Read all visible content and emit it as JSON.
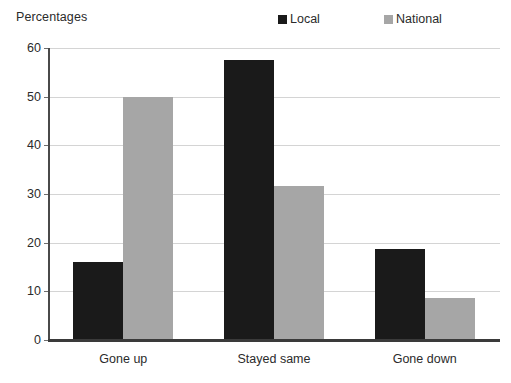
{
  "chart_data": {
    "type": "bar",
    "title": "",
    "ylabel": "Percentages",
    "xlabel": "",
    "categories": [
      "Gone up",
      "Stayed same",
      "Gone down"
    ],
    "series": [
      {
        "name": "Local",
        "color": "#1a1a1a",
        "values": [
          16.0,
          57.5,
          18.8
        ]
      },
      {
        "name": "National",
        "color": "#a6a6a6",
        "values": [
          49.9,
          31.7,
          8.7
        ]
      }
    ],
    "ylim": [
      0,
      60
    ],
    "yticks": [
      0,
      10,
      20,
      30,
      40,
      50,
      60
    ],
    "ytick_labels": [
      "0",
      "10",
      "20",
      "30",
      "40",
      "50",
      "60"
    ],
    "grid": true,
    "grid_axis": "y",
    "legend_position": "top-right",
    "legend_marker": "square-icon"
  },
  "colors": {
    "local": "#1a1a1a",
    "national": "#a6a6a6",
    "gridline": "#d4d4d4",
    "axis": "#3a3a3a",
    "text": "#2b2b2b",
    "background": "#ffffff"
  }
}
